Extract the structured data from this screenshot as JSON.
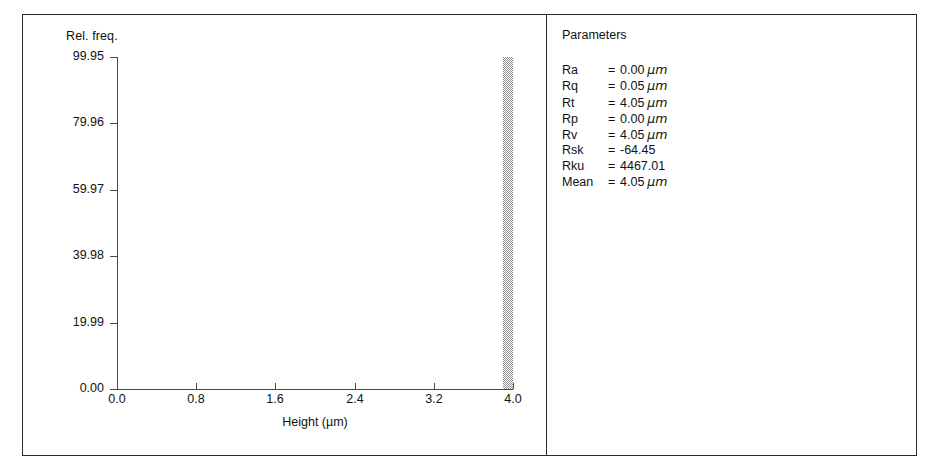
{
  "figure": {
    "divider_x": 546,
    "border_color": "#2b2b2b"
  },
  "chart_data": {
    "type": "bar",
    "title": "",
    "xlabel": "Height (µm)",
    "ylabel": "Rel. freq.",
    "xlim": [
      0.0,
      4.0
    ],
    "ylim": [
      0.0,
      99.95
    ],
    "grid": false,
    "legend": null,
    "xticks": [
      "0.0",
      "0.8",
      "1.6",
      "2.4",
      "3.2",
      "4.0"
    ],
    "xtick_values": [
      0.0,
      0.8,
      1.6,
      2.4,
      3.2,
      4.0
    ],
    "yticks": [
      "0.00",
      "19.99",
      "39.98",
      "59.97",
      "79.96",
      "99.95"
    ],
    "ytick_values": [
      0.0,
      19.99,
      39.98,
      59.97,
      79.96,
      99.95
    ],
    "categories": [
      "3.95"
    ],
    "values": [
      99.95
    ],
    "bars": [
      {
        "x_center": 3.95,
        "x_left": 3.9,
        "x_right": 4.0,
        "value": 99.95
      }
    ]
  },
  "parameters": {
    "title": "Parameters",
    "rows": [
      {
        "name": "Ra",
        "eq": "=",
        "value": "0.00",
        "unit": "µm"
      },
      {
        "name": "Rq",
        "eq": "=",
        "value": "0.05",
        "unit": "µm"
      },
      {
        "name": "Rt",
        "eq": "=",
        "value": "4.05",
        "unit": "µm"
      },
      {
        "name": "Rp",
        "eq": "=",
        "value": "0.00",
        "unit": "µm"
      },
      {
        "name": "Rv",
        "eq": "=",
        "value": "4.05",
        "unit": "µm"
      },
      {
        "name": "Rsk",
        "eq": "=",
        "value": "-64.45",
        "unit": ""
      },
      {
        "name": "Rku",
        "eq": "=",
        "value": "4467.01",
        "unit": ""
      },
      {
        "name": "Mean",
        "eq": "=",
        "value": "4.05",
        "unit": "µm"
      }
    ]
  }
}
